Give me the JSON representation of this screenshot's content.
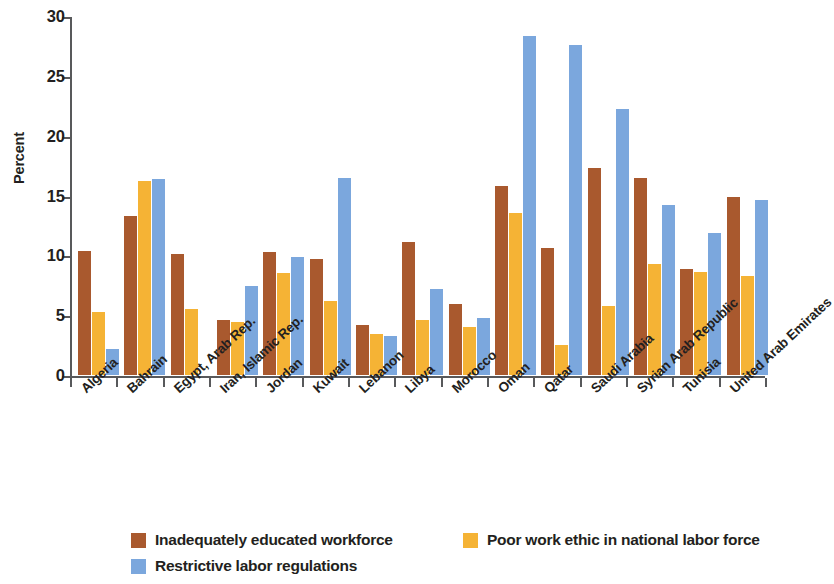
{
  "chart_data": {
    "type": "bar",
    "title": "",
    "subtitle": "",
    "xlabel": "",
    "ylabel": "Percent",
    "ylim": [
      0,
      30
    ],
    "yticks": [
      0,
      5,
      10,
      15,
      20,
      25,
      30
    ],
    "ytick_labels": [
      "0",
      "5",
      "10",
      "15",
      "20",
      "25",
      "30"
    ],
    "grid": false,
    "legend_position": "bottom",
    "categories": [
      "Algeria",
      "Bahrain",
      "Egypt, Arab Rep.",
      "Iran, Islamic Rep.",
      "Jordan",
      "Kuwait",
      "Lebanon",
      "Libya",
      "Morocco",
      "Oman",
      "Qatar",
      "Saudi Arabia",
      "Syrian Arab Republic",
      "Tunisia",
      "United Arab Emirates"
    ],
    "series": [
      {
        "name": "Inadequately educated workforce",
        "color": "#a9592e",
        "values": [
          10.4,
          13.3,
          10.1,
          4.6,
          10.3,
          9.7,
          4.2,
          11.1,
          5.9,
          15.8,
          10.6,
          17.3,
          16.5,
          8.9,
          14.9
        ]
      },
      {
        "name": "Poor work ethic in national labor force",
        "color": "#f5b335",
        "values": [
          5.3,
          16.2,
          5.5,
          4.4,
          8.5,
          6.2,
          3.4,
          4.6,
          4.0,
          13.5,
          2.5,
          5.8,
          9.3,
          8.6,
          8.3
        ]
      },
      {
        "name": "Restrictive labor regulations",
        "color": "#7ba7dd",
        "values": [
          2.2,
          16.4,
          0.0,
          7.4,
          9.9,
          16.5,
          3.3,
          7.2,
          4.8,
          28.3,
          27.6,
          22.2,
          14.2,
          11.9,
          14.6
        ]
      }
    ]
  },
  "legend": {
    "items": [
      {
        "label": "Inadequately educated workforce",
        "color": "#a9592e"
      },
      {
        "label": "Poor work ethic in national labor force",
        "color": "#f5b335"
      },
      {
        "label": "Restrictive labor regulations",
        "color": "#7ba7dd"
      }
    ]
  }
}
